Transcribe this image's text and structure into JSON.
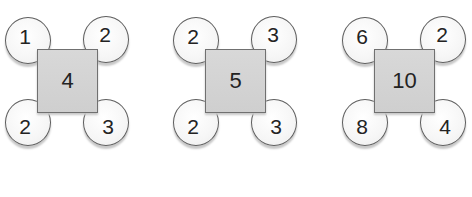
{
  "figures": [
    {
      "center": "4",
      "corners": {
        "top_left": "1",
        "top_right": "2",
        "bottom_left": "2",
        "bottom_right": "3"
      }
    },
    {
      "center": "5",
      "corners": {
        "top_left": "2",
        "top_right": "3",
        "bottom_left": "2",
        "bottom_right": "3"
      }
    },
    {
      "center": "10",
      "corners": {
        "top_left": "6",
        "top_right": "2",
        "bottom_left": "8",
        "bottom_right": "4"
      }
    }
  ],
  "colors": {
    "square_fill": "#d4d4d4",
    "square_border": "#707070",
    "circle_fill": "#f6f6f6",
    "circle_border": "#5e5e5e",
    "text": "#232323"
  }
}
